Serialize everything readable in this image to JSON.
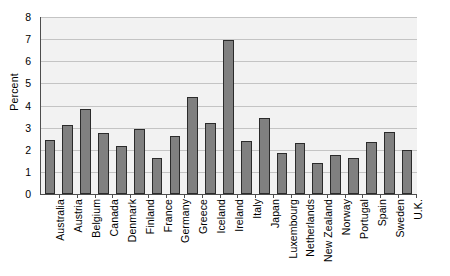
{
  "chart_data": {
    "type": "bar",
    "title": "",
    "subtitle": "",
    "xlabel": "",
    "ylabel": "Percent",
    "ylim": [
      0,
      8
    ],
    "ytick_labels": [
      "0",
      "1",
      "2",
      "3",
      "4",
      "5",
      "6",
      "7",
      "8"
    ],
    "yticks": [
      0,
      1,
      2,
      3,
      4,
      5,
      6,
      7,
      8
    ],
    "grid": true,
    "legend": null,
    "bar_color": "#808080",
    "bar_edge_color": "#2b2b2b",
    "plot_background": "#f2f2f2",
    "categories": [
      "Australia",
      "Austria",
      "Belgium",
      "Canada",
      "Denmark",
      "Finland",
      "France",
      "Germany",
      "Greece",
      "Iceland",
      "Ireland",
      "Italy",
      "Japan",
      "Luxembourg",
      "Netherlands",
      "New Zealand",
      "Norway",
      "Portugal",
      "Spain",
      "Sweden",
      "U.K."
    ],
    "values": [
      2.45,
      3.1,
      3.85,
      2.75,
      2.15,
      2.95,
      1.65,
      2.6,
      4.4,
      3.2,
      6.95,
      2.4,
      3.45,
      1.85,
      2.3,
      1.4,
      1.75,
      1.65,
      2.35,
      2.8,
      2.0
    ]
  }
}
